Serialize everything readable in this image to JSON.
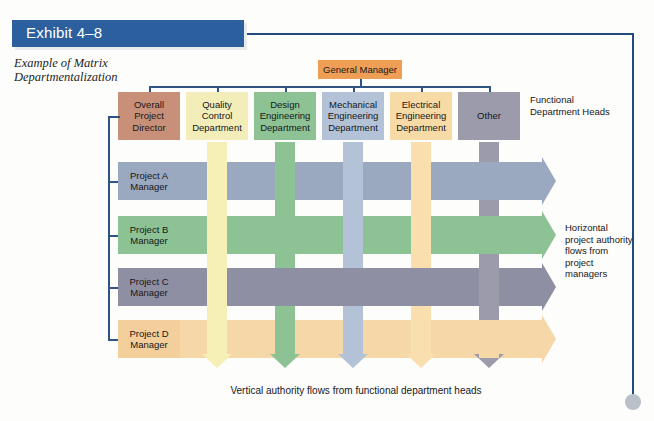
{
  "exhibit": {
    "banner_label": "Exhibit 4–8",
    "subtitle": "Example of Matrix Departmentalization",
    "banner_color": "#2b5f9e"
  },
  "top": {
    "general_manager": "General Manager"
  },
  "functional_heads_caption": "Functional Department Heads",
  "horizontal_authority_caption": "Horizontal project authority flows from project managers",
  "bottom_caption": "Vertical authority flows from functional department heads",
  "columns": [
    {
      "label": "Overall Project Director",
      "color": "#c89078",
      "band_color": "#c89078",
      "has_band": false,
      "x": 118,
      "width": 62
    },
    {
      "label": "Quality Control Department",
      "color": "#f2edb9",
      "band_color": "#f6f0b6",
      "has_band": true,
      "x": 186,
      "width": 62
    },
    {
      "label": "Design Engineering Department",
      "color": "#8cc294",
      "band_color": "#8cc294",
      "has_band": true,
      "x": 254,
      "width": 62
    },
    {
      "label": "Mechanical Engineering Department",
      "color": "#b3c2d6",
      "band_color": "#b3c2d6",
      "has_band": true,
      "x": 322,
      "width": 62
    },
    {
      "label": "Electrical Engineering Department",
      "color": "#f7dba6",
      "band_color": "#f9dfae",
      "has_band": true,
      "x": 390,
      "width": 62
    },
    {
      "label": "Other",
      "color": "#9b9bac",
      "band_color": "#9b9bac",
      "has_band": true,
      "x": 458,
      "width": 62
    }
  ],
  "rows": [
    {
      "label": "Project A Manager",
      "color": "#9aa8c0",
      "band_color": "#9aa8c0",
      "y": 162,
      "height": 38
    },
    {
      "label": "Project B Manager",
      "color": "#8cc294",
      "band_color": "#8cc294",
      "y": 216,
      "height": 38
    },
    {
      "label": "Project C Manager",
      "color": "#8f8fa3",
      "band_color": "#8f8fa3",
      "y": 268,
      "height": 38
    },
    {
      "label": "Project D Manager",
      "color": "#f3cf9c",
      "band_color": "#f5d7a8",
      "y": 320,
      "height": 38
    }
  ],
  "colors": {
    "connector": "#2f5382",
    "general_manager_box": "#ef9f55",
    "frame": "#234a7d",
    "dot": "#b9c0ca"
  }
}
